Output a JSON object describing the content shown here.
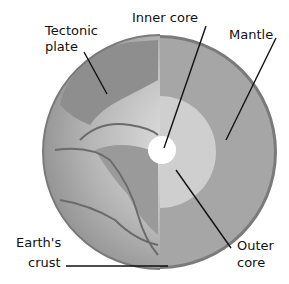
{
  "labels": {
    "tectonic_plate": [
      "Tectonic",
      "plate"
    ],
    "inner_core": "Inner core",
    "mantle": "Mantle",
    "earths_crust": [
      "Earth's",
      "crust"
    ],
    "outer_core": [
      "Outer",
      "core"
    ]
  },
  "colors": {
    "ocean": "#a9a9a9",
    "land": "#8c8c8c",
    "mantle": "#a4a4a4",
    "outer_core": "#cfcfcf",
    "inner_core": "#ffffff",
    "crust": "#7a7a7a"
  }
}
